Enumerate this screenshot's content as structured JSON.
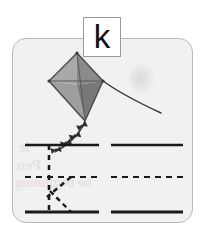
{
  "worksheet": {
    "type": "handwriting-practice-card",
    "letter": "k",
    "letter_case": "lowercase",
    "keyword": "kite",
    "card": {
      "background_color": "#f1f1f1",
      "border_color": "#b9b9b9",
      "corner_radius_px": 14
    },
    "letter_box": {
      "glyph": "k",
      "background_color": "#ffffff",
      "border_color": "#9a9a9a"
    },
    "illustration": {
      "name": "kite",
      "description": "gray diamond kite with four triangular panels, a curved string trailing to the lower right and a knotted tail trailing to the lower left",
      "panel_colors": [
        "#b4b4b4",
        "#8c8c8c",
        "#a2a2a2",
        "#7e7e7e"
      ],
      "outline_color": "#4a4a4a",
      "string_color": "#3a3a3a",
      "tail_knot_count": 4
    },
    "guide_lines": {
      "line_color": "#1a1a1a",
      "dash_color": "#1a1a1a",
      "rows": [
        {
          "name": "top-line",
          "style": "solid"
        },
        {
          "name": "middle-line",
          "style": "dashed"
        },
        {
          "name": "baseline",
          "style": "solid"
        }
      ],
      "columns": [
        {
          "name": "left-practice-column",
          "contains_trace_letter": true
        },
        {
          "name": "right-practice-column",
          "contains_trace_letter": false
        }
      ]
    },
    "trace_letter": {
      "glyph": "k",
      "style": "dashed",
      "color": "#1a1a1a",
      "strokes": [
        {
          "name": "stem",
          "description": "vertical dashed line from top line to baseline"
        },
        {
          "name": "arm",
          "description": "dashed diagonal from middle line down-left into the stem"
        },
        {
          "name": "leg",
          "description": "dashed diagonal from stem junction down-right to baseline"
        }
      ]
    },
    "watermark": {
      "visible": true,
      "description": "faint mirrored bleed-through text behind the guide lines",
      "lines": [
        "le",
        "Pen",
        "he beginning"
      ],
      "color": "#e6e0e0"
    }
  }
}
